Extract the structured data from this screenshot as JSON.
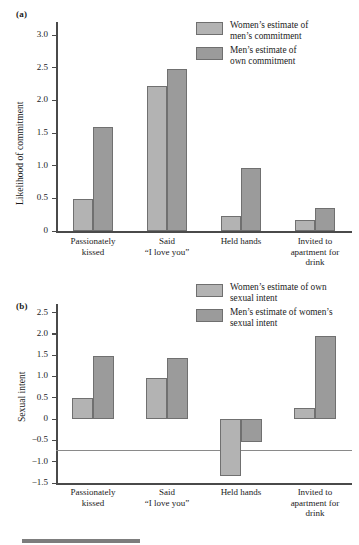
{
  "figure": {
    "panel_a_label": "(a)",
    "panel_b_label": "(b)"
  },
  "colors": {
    "series_women": "#b3b3b3",
    "series_men": "#9b9b9b",
    "bar_stroke": "#707070",
    "axis": "#4a4a4a",
    "text": "#1b1b1b",
    "caption_rule": "#7d7d7d"
  },
  "chart_data": [
    {
      "type": "bar",
      "panel": "(a)",
      "title": "",
      "xlabel": "",
      "ylabel": "Likelihood of commitment",
      "ylim": [
        0,
        3.2
      ],
      "grid": false,
      "legend_position": "top-right",
      "categories": [
        "Passionately\nkissed",
        "Said\n“I love you”",
        "Held hands",
        "Invited to\napartment for\ndrink"
      ],
      "ytick_labels": [
        "0",
        "0.5",
        "1.0",
        "1.5",
        "2.0",
        "2.5",
        "3.0"
      ],
      "ytick_values": [
        0,
        0.5,
        1.0,
        1.5,
        2.0,
        2.5,
        3.0
      ],
      "series": [
        {
          "name": "Women’s estimate of\nmen’s commitment",
          "color": "#b3b3b3",
          "values": [
            0.49,
            2.22,
            0.23,
            0.17
          ]
        },
        {
          "name": "Men’s estimate of\nown commitment",
          "color": "#9b9b9b",
          "values": [
            1.6,
            2.48,
            0.97,
            0.35
          ]
        }
      ]
    },
    {
      "type": "bar",
      "panel": "(b)",
      "title": "",
      "xlabel": "",
      "ylabel": "Sexual intent",
      "ylim": [
        -1.5,
        2.7
      ],
      "grid": false,
      "legend_position": "top-right",
      "categories": [
        "Passionately\nkissed",
        "Said\n“I love you”",
        "Held hands",
        "Invited to\napartment for\ndrink"
      ],
      "ytick_labels": [
        "2.5",
        "2.0",
        "1.5",
        "1.0",
        "0.5",
        "0",
        "−0.5",
        "−1.0",
        "−1.5"
      ],
      "ytick_values": [
        2.5,
        2.0,
        1.5,
        1.0,
        0.5,
        0,
        -0.5,
        -1.0,
        -1.5
      ],
      "series": [
        {
          "name": "Women’s estimate of own\nsexual intent",
          "color": "#b3b3b3",
          "values": [
            0.49,
            0.96,
            -1.33,
            0.26
          ]
        },
        {
          "name": "Men’s estimate of women’s\nsexual intent",
          "color": "#9b9b9b",
          "values": [
            1.49,
            1.43,
            -0.54,
            1.94
          ]
        }
      ]
    }
  ]
}
